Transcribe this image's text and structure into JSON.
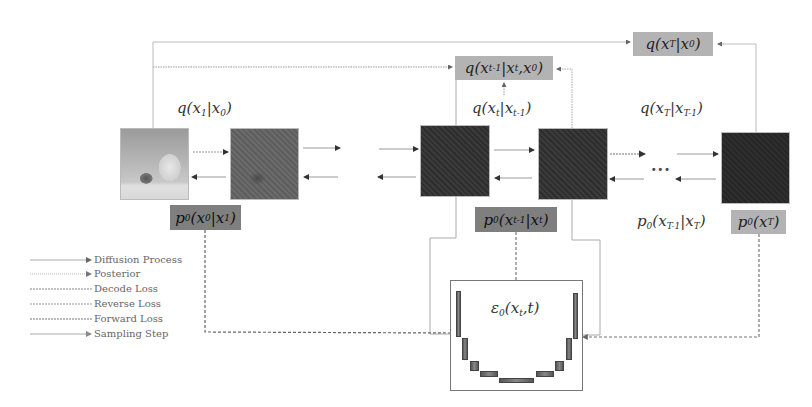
{
  "diagram": {
    "type": "diffusion-model-process",
    "images": [
      {
        "id": "x0",
        "style": "photo",
        "description": "kitten and baby photo"
      },
      {
        "id": "x1",
        "style": "slightly-noisy"
      },
      {
        "id": "xt_minus_1",
        "style": "noisy"
      },
      {
        "id": "xt",
        "style": "noisy"
      },
      {
        "id": "xT",
        "style": "pure-noise"
      }
    ],
    "labels": {
      "q_x1_x0": {
        "func": "q",
        "arg": "x",
        "arg_sub": "1",
        "cond": "x",
        "cond_sub": "0"
      },
      "q_xt_xt1": {
        "func": "q",
        "arg": "x",
        "arg_sub": "t",
        "cond": "x",
        "cond_sub": "t-1"
      },
      "q_xT_xT1": {
        "func": "q",
        "arg": "x",
        "arg_sub": "T",
        "cond": "x",
        "cond_sub": "T-1"
      },
      "q_posterior": {
        "func": "q",
        "arg": "x",
        "arg_sub": "t-1",
        "cond": "x",
        "cond_sub": "t",
        "cond2": "x",
        "cond2_sub": "0"
      },
      "q_xT_x0": {
        "func": "q",
        "arg": "x",
        "arg_sub": "T",
        "cond": "x",
        "cond_sub": "0"
      },
      "p_x0_x1": {
        "func": "p",
        "func_sub": "0",
        "arg": "x",
        "arg_sub": "0",
        "cond": "x",
        "cond_sub": "1"
      },
      "p_xt1_xt": {
        "func": "p",
        "func_sub": "0",
        "arg": "x",
        "arg_sub": "t-1",
        "cond": "x",
        "cond_sub": "t"
      },
      "p_xT1_xT": {
        "func": "p",
        "func_sub": "0",
        "arg": "x",
        "arg_sub": "T-1",
        "cond": "x",
        "cond_sub": "T"
      },
      "p_xT": {
        "func": "p",
        "func_sub": "0",
        "arg": "x",
        "arg_sub": "T"
      },
      "eps": {
        "func": "ε",
        "func_sub": "0",
        "arg": "x",
        "arg_sub": "t",
        "arg2": "t"
      }
    },
    "ellipsis": "···",
    "unet_label": "noise predictor network"
  },
  "legend": {
    "items": [
      {
        "label": "Diffusion Process",
        "line": "solid-arrow"
      },
      {
        "label": "Posterior",
        "line": "dotted-arrow"
      },
      {
        "label": "Decode Loss",
        "line": "dashed"
      },
      {
        "label": "Reverse Loss",
        "line": "dashed"
      },
      {
        "label": "Forward Loss",
        "line": "dashed"
      },
      {
        "label": "Sampling Step",
        "line": "solid-arrow"
      }
    ]
  },
  "colors": {
    "line": "#9a9a9a",
    "arrowhead": "#333333",
    "light_label_bg": "#b3b3b3",
    "dark_label_bg": "#7f7f7f",
    "dashed": "#666666"
  }
}
